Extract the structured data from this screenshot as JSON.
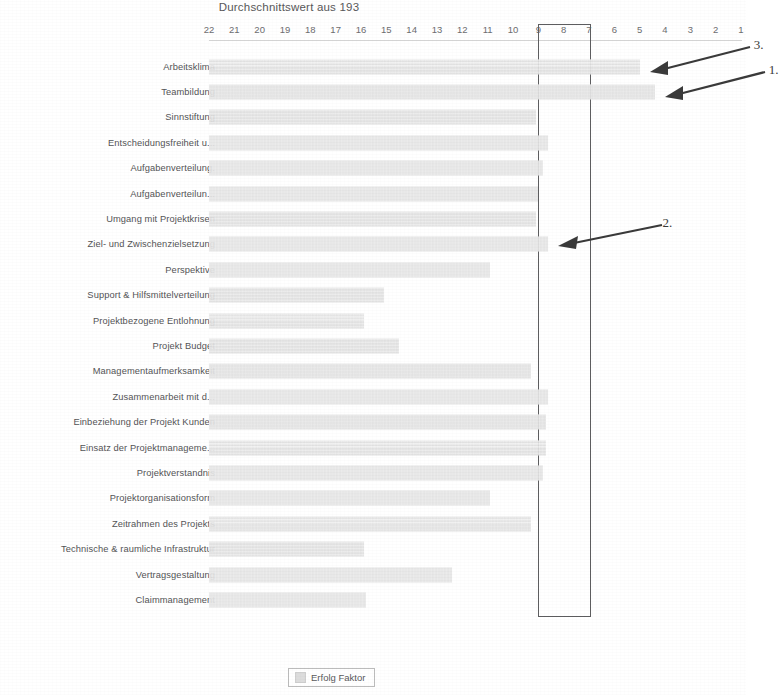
{
  "chart_data": {
    "type": "bar",
    "orientation": "horizontal",
    "title": "Durchschnittswert aus 193",
    "xlabel": "",
    "ylabel": "Faktor",
    "xlim": [
      22,
      1
    ],
    "x_axis_reversed": true,
    "x_axis_position": "top",
    "grid": false,
    "legend": {
      "position": "bottom",
      "entries": [
        {
          "label": "Erfolg Faktor",
          "color": "#dcdcdc"
        }
      ]
    },
    "tick_labels": [
      "22",
      "21",
      "20",
      "19",
      "18",
      "17",
      "16",
      "15",
      "14",
      "13",
      "12",
      "11",
      "10",
      "9",
      "8",
      "7",
      "6",
      "5",
      "4",
      "3",
      "2",
      "1"
    ],
    "categories": [
      "Arbeitsklima",
      "Teambildung",
      "Sinnstiftung",
      "Entscheidungsfreiheit u...",
      "Aufgabenverteilung.",
      "Aufgabenverteilun...",
      "Umgang mit Projektkrisen",
      "Ziel- und Zwischenzielsetzung",
      "Perspektive",
      "Support & Hilfsmittelverteilung",
      "Projektbezogene Entlohnung",
      "Projekt Budget",
      "Managementaufmerksamkeit",
      "Zusammenarbeit mit d...",
      "Einbeziehung der Projekt Kunden",
      "Einsatz der Projektmanageme...",
      "Projektverstandnis",
      "Projektorganisationsform",
      "Zeitrahmen des Projekts",
      "Technische & raumliche Infrastruktur",
      "Vertragsgestaltung",
      "Claimmanagement"
    ],
    "values": [
      5.0,
      4.4,
      9.1,
      8.6,
      8.8,
      9.0,
      9.1,
      8.6,
      10.9,
      15.1,
      15.9,
      14.5,
      9.3,
      8.6,
      8.7,
      8.7,
      8.8,
      10.9,
      9.3,
      15.9,
      12.4,
      15.8
    ],
    "highlight_box": {
      "from": 9,
      "to": 7
    },
    "annotations": [
      {
        "label": "3.",
        "target_category": "Arbeitsklima"
      },
      {
        "label": "1.",
        "target_category": "Teambildung"
      },
      {
        "label": "2.",
        "target_category": "Ziel- und Zwischenzielsetzung"
      }
    ],
    "colors": {
      "bar": "#dcdcdc",
      "box": "#5d5d5f",
      "text": "#545456"
    }
  }
}
